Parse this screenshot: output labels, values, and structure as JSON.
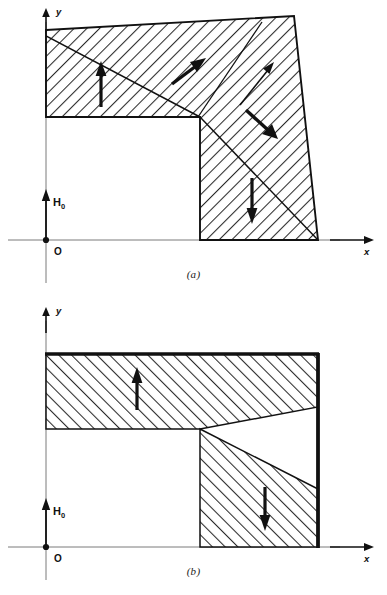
{
  "figure": {
    "type": "technical-diagram",
    "background_color": "#ffffff",
    "ink_color": "#111111",
    "hatch_color": "#333333"
  },
  "panels": [
    {
      "id": "a",
      "caption": "(a)",
      "hatch_direction": "backslash",
      "axes": {
        "y_label": "y",
        "x_label": "x",
        "origin_label": "O",
        "field_label": "H",
        "field_subscript": "0"
      },
      "arrows": [
        {
          "name": "magnetization-up-left",
          "direction": "up",
          "label": ""
        },
        {
          "name": "magnetization-up-right-diagonal",
          "direction": "up-right",
          "label": ""
        },
        {
          "name": "magnetization-thin-diagonal",
          "direction": "up-right-thin",
          "label": ""
        },
        {
          "name": "magnetization-down-right-diagonal",
          "direction": "down-right",
          "label": ""
        },
        {
          "name": "magnetization-down-right-leg",
          "direction": "down",
          "label": ""
        }
      ],
      "shape_note": "L-shaped region with slanted top edge and slanted right edge; a diagonal domain wall runs from upper-left through the inner corner to the lower-right corner"
    },
    {
      "id": "b",
      "caption": "(b)",
      "hatch_direction": "slash",
      "axes": {
        "y_label": "y",
        "x_label": "x",
        "origin_label": "O",
        "field_label": "H",
        "field_subscript": "0"
      },
      "arrows": [
        {
          "name": "magnetization-up-arm",
          "direction": "up",
          "label": ""
        },
        {
          "name": "magnetization-down-leg",
          "direction": "down",
          "label": ""
        }
      ],
      "shape_note": "L-shaped region with thick top and right borders; a triangular white notch is cut into the right side with its apex at the inner corner"
    }
  ]
}
